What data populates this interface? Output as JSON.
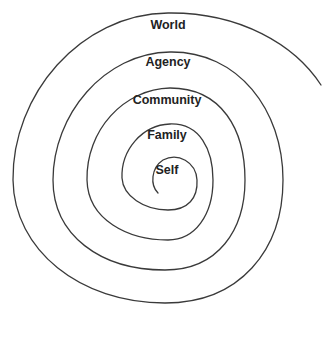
{
  "diagram": {
    "type": "spiral",
    "stroke_color": "#3a3a3a",
    "levels": [
      {
        "label": "Self",
        "x": 167,
        "y": 164
      },
      {
        "label": "Family",
        "x": 167,
        "y": 129
      },
      {
        "label": "Community",
        "x": 167,
        "y": 94
      },
      {
        "label": "Agency",
        "x": 168,
        "y": 56
      },
      {
        "label": "World",
        "x": 168,
        "y": 19
      }
    ]
  }
}
